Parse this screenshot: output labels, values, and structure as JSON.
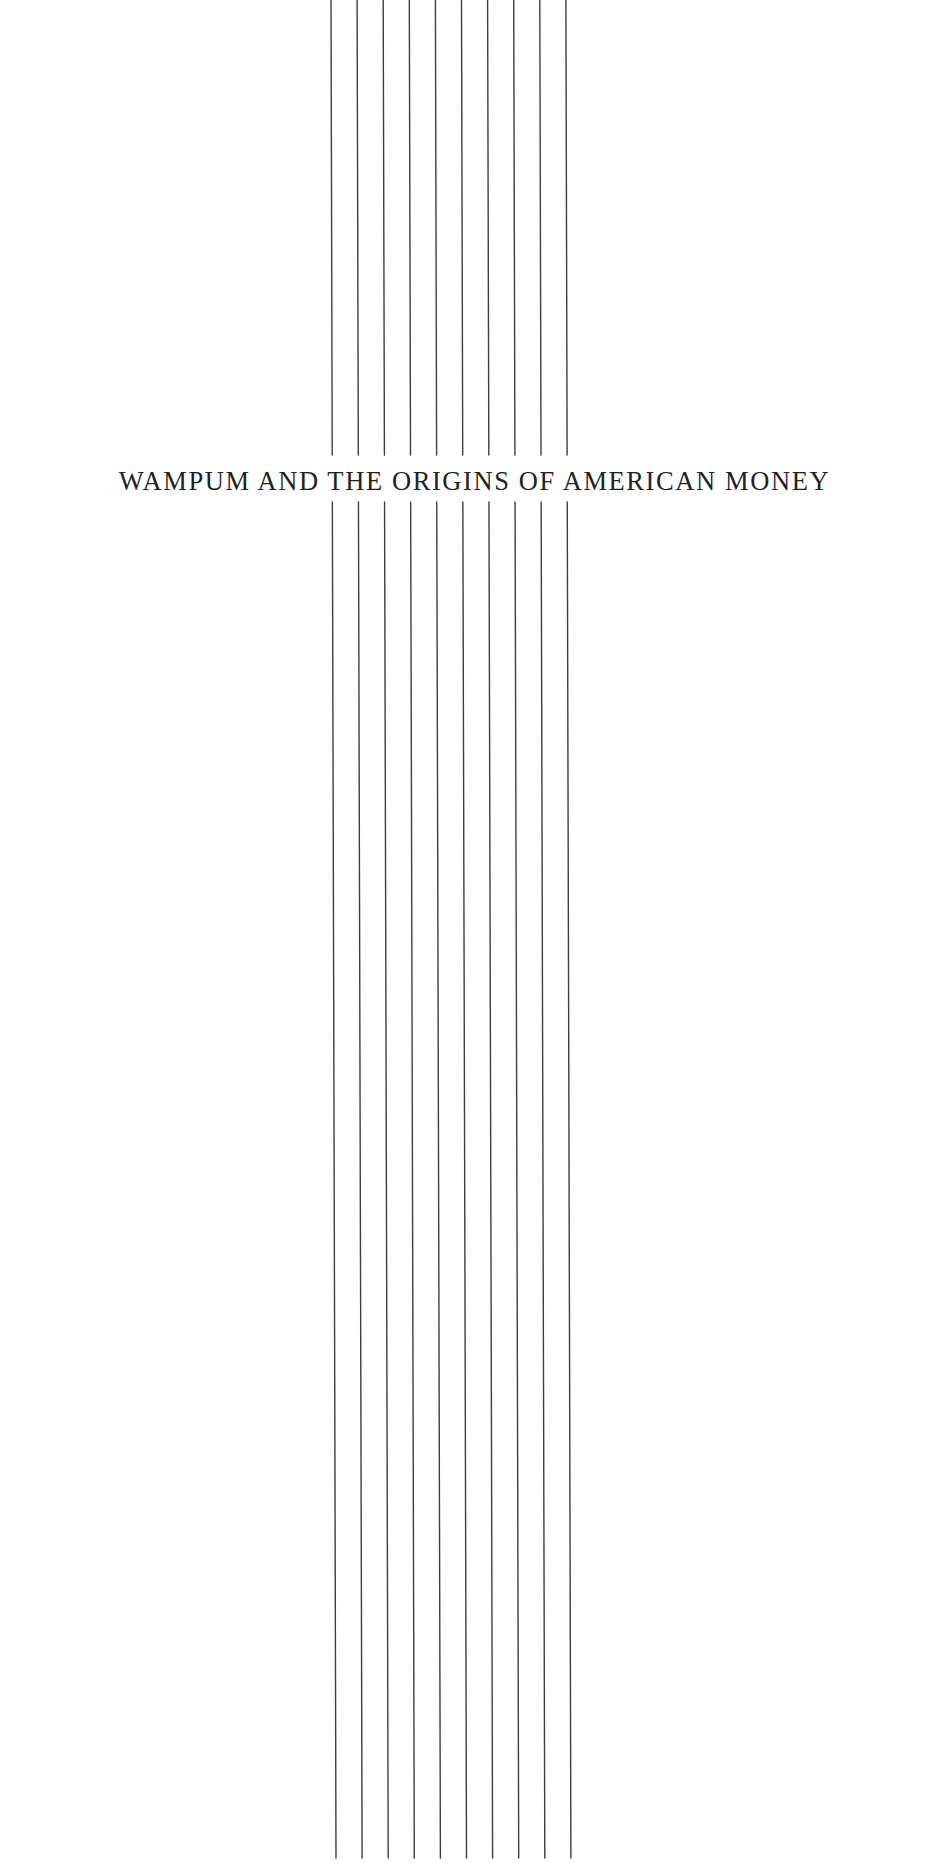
{
  "page": {
    "title": "WAMPUM AND THE ORIGINS OF AMERICAN MONEY",
    "background_color": "#ffffff",
    "text_color": "#222222",
    "line_color": "#3e3e3e"
  },
  "decoration": {
    "strings": {
      "count": 10,
      "top_x_start": 331,
      "bottom_x_start": 336,
      "spacing": 26.1,
      "upper_segment": [
        0,
        455
      ],
      "lower_segment": [
        502,
        1858
      ]
    }
  }
}
